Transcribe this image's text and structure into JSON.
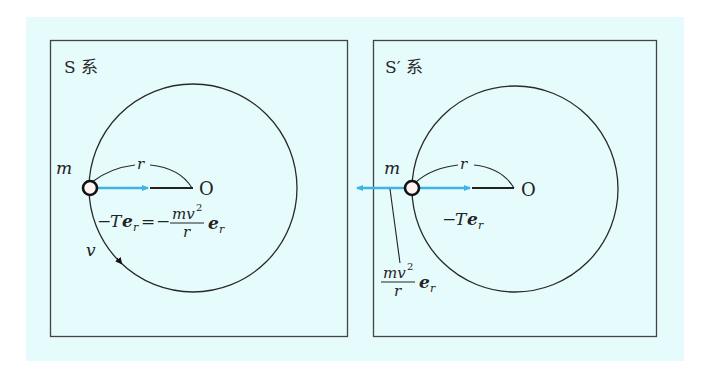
{
  "colors": {
    "background": "#e6fbfc",
    "frame_border": "#444444",
    "circle": "#2a2a2a",
    "force_arrow": "#3cb4e6",
    "string": "#222222",
    "mass_fill": "#fff4f2"
  },
  "left_panel": {
    "frame_label": "S 系",
    "mass_label": "m",
    "radius_label": "r",
    "origin_label": "O",
    "velocity_label": "v",
    "force_equation": {
      "lhs_sign": "−",
      "lhs_T": "T",
      "lhs_e": "e",
      "lhs_sub": "r",
      "equals": "=",
      "rhs_sign": "−",
      "rhs_numerator": "mv",
      "rhs_exponent": "2",
      "rhs_denominator": "r",
      "rhs_e": "e",
      "rhs_sub": "r"
    }
  },
  "right_panel": {
    "frame_label": "S′ 系",
    "mass_label": "m",
    "radius_label": "r",
    "origin_label": "O",
    "tension_label": {
      "sign": "−",
      "T": "T",
      "e": "e",
      "sub": "r"
    },
    "centrifugal_label": {
      "numerator": "mv",
      "exponent": "2",
      "denominator": "r",
      "e": "e",
      "sub": "r"
    }
  }
}
